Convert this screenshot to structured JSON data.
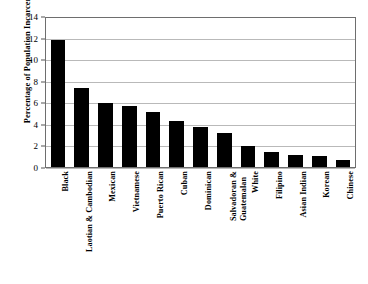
{
  "chart_data": {
    "type": "bar",
    "title": "",
    "subtitle": "",
    "xlabel": "",
    "ylabel": "Percentage of Population Incarcerated",
    "ylim": [
      0,
      14
    ],
    "ytick_step": 2,
    "yticks": [
      "0",
      "2",
      "4",
      "6",
      "8",
      "10",
      "12",
      "14"
    ],
    "grid": true,
    "legend": false,
    "bar_color": "#000000",
    "gridline_color": "#b9b9b9",
    "axis_color": "#6e6e6e",
    "categories": [
      "Black",
      "Laotian & Cambodian",
      "Mexican",
      "Vietnamese",
      "Puerto Rican",
      "Cuban",
      "Dominican",
      "Salvadoran & Guatemalan",
      "White",
      "Filipino",
      "Asian Indian",
      "Korean",
      "Chinese"
    ],
    "category_lines": [
      [
        "Black"
      ],
      [
        "Laotian & Cambodian"
      ],
      [
        "Mexican"
      ],
      [
        "Vietnamese"
      ],
      [
        "Puerto Rican"
      ],
      [
        "Cuban"
      ],
      [
        "Dominican"
      ],
      [
        "Salvadoran &",
        "Guatemalan"
      ],
      [
        "White"
      ],
      [
        "Filipino"
      ],
      [
        "Asian Indian"
      ],
      [
        "Korean"
      ],
      [
        "Chinese"
      ]
    ],
    "values": [
      11.9,
      7.4,
      6.0,
      5.7,
      5.2,
      4.3,
      3.8,
      3.2,
      1.95,
      1.4,
      1.1,
      1.0,
      0.65
    ]
  }
}
